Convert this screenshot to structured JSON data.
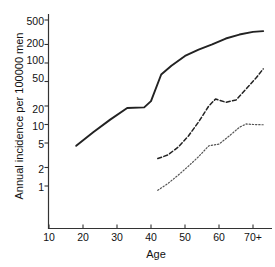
{
  "chart_data": {
    "type": "line",
    "title": "",
    "subtitle": "",
    "xlabel": "Age",
    "ylabel": "Annual incidence per 100000 men",
    "yscale": "log",
    "xscale": "linear",
    "xlim": [
      10,
      73
    ],
    "ylim": [
      0.8,
      600
    ],
    "grid": false,
    "legend": "none",
    "x_ticks": [
      {
        "value": 10,
        "label": "10"
      },
      {
        "value": 20,
        "label": "20"
      },
      {
        "value": 30,
        "label": "30"
      },
      {
        "value": 40,
        "label": "40"
      },
      {
        "value": 50,
        "label": "50"
      },
      {
        "value": 60,
        "label": "60"
      },
      {
        "value": 70,
        "label": "70+"
      }
    ],
    "y_ticks": [
      {
        "value": 1,
        "label": "1"
      },
      {
        "value": 2,
        "label": "2"
      },
      {
        "value": 5,
        "label": "5"
      },
      {
        "value": 10,
        "label": "10"
      },
      {
        "value": 20,
        "label": "20"
      },
      {
        "value": 50,
        "label": "50"
      },
      {
        "value": 100,
        "label": "100"
      },
      {
        "value": 200,
        "label": "200"
      },
      {
        "value": 500,
        "label": "500"
      }
    ],
    "series": [
      {
        "name": "solid-series",
        "style": "solid",
        "color": "#222222",
        "x": [
          18,
          23,
          28,
          33,
          38,
          40,
          43,
          46,
          50,
          54,
          58,
          62,
          66,
          70,
          73
        ],
        "y": [
          4.5,
          7.5,
          12,
          18.5,
          19,
          24,
          65,
          90,
          130,
          165,
          200,
          250,
          290,
          320,
          330
        ]
      },
      {
        "name": "dashed-series",
        "style": "dashed",
        "color": "#222222",
        "x": [
          42,
          45,
          48,
          51,
          54,
          57,
          59,
          62,
          65,
          68,
          71,
          73
        ],
        "y": [
          2.8,
          3.2,
          4.3,
          6.5,
          11,
          20,
          26,
          23,
          25,
          38,
          58,
          80
        ]
      },
      {
        "name": "dotted-series",
        "style": "dotted",
        "color": "#555555",
        "x": [
          42,
          45,
          48,
          51,
          54,
          57,
          60,
          63,
          66,
          68,
          70,
          73
        ],
        "y": [
          0.85,
          1.1,
          1.5,
          2.1,
          3.0,
          4.5,
          4.8,
          6.5,
          9.0,
          10.2,
          10.0,
          9.9
        ]
      }
    ]
  },
  "axes": {
    "ylabel": "Annual incidence per 100000 men",
    "xlabel": "Age",
    "ytick_labels": [
      "500",
      "200",
      "100",
      "50",
      "20",
      "10",
      "5",
      "2",
      "1"
    ],
    "xtick_labels": [
      "10",
      "20",
      "30",
      "40",
      "50",
      "60",
      "70+"
    ]
  }
}
